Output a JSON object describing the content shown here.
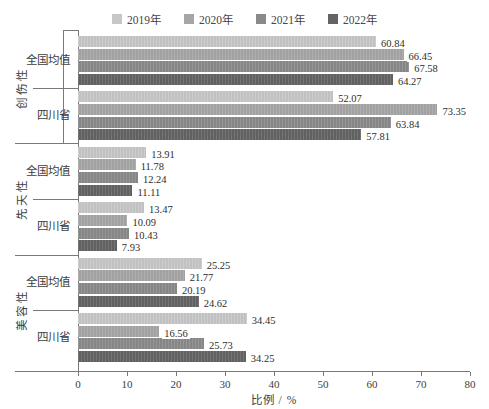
{
  "chart_data": {
    "type": "bar",
    "orientation": "horizontal",
    "title": "",
    "xlabel": "比例 / %",
    "xlim": [
      0,
      80
    ],
    "xticks": [
      "0",
      "10",
      "20",
      "30",
      "40",
      "50",
      "60",
      "70",
      "80"
    ],
    "grid": false,
    "legend_position": "top",
    "legend": [
      "2019年",
      "2020年",
      "2021年",
      "2022年"
    ],
    "series_colors": [
      "#c7c7c7",
      "#a6a6a6",
      "#8a8a8a",
      "#646464"
    ],
    "major_categories": [
      "创伤性",
      "先天性",
      "美容性"
    ],
    "groups": [
      {
        "category": "创伤性",
        "subgroup": "全国均值",
        "values": [
          60.84,
          66.45,
          67.58,
          64.27
        ]
      },
      {
        "category": "创伤性",
        "subgroup": "四川省",
        "values": [
          52.07,
          73.35,
          63.84,
          57.81
        ]
      },
      {
        "category": "先天性",
        "subgroup": "全国均值",
        "values": [
          13.91,
          11.78,
          12.24,
          11.11
        ]
      },
      {
        "category": "先天性",
        "subgroup": "四川省",
        "values": [
          13.47,
          10.09,
          10.43,
          7.93
        ]
      },
      {
        "category": "美容性",
        "subgroup": "全国均值",
        "values": [
          25.25,
          21.77,
          20.19,
          24.62
        ]
      },
      {
        "category": "美容性",
        "subgroup": "四川省",
        "values": [
          34.45,
          16.56,
          25.73,
          34.25
        ]
      }
    ]
  }
}
